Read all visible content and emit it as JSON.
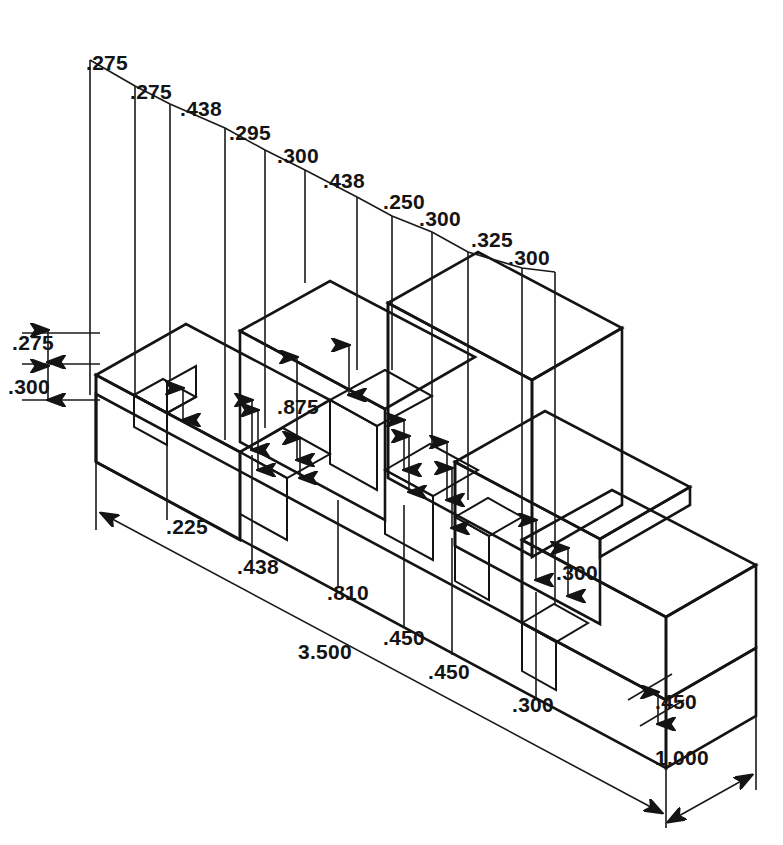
{
  "drawing": {
    "title": "Isometric dimensioned stepped slotted block",
    "view": "isometric",
    "units_implied": "inches",
    "background_color": "#ffffff",
    "line_color": "#141414",
    "face_colors": {
      "top": "#b9b9b9",
      "front": "#8a8a8a",
      "right": "#9e9e9e",
      "slot_inner_light": "#c4c4c4",
      "slot_inner_dark": "#7a7a7a"
    }
  },
  "top_chain": {
    "label": "top-dimension-chain",
    "description": "Stacked chain of length dimensions along the top, stepping down to the right",
    "values": [
      ".275",
      ".275",
      ".438",
      ".295",
      ".300",
      ".438",
      ".250",
      ".300",
      ".325",
      ".300"
    ]
  },
  "left_chain": {
    "label": "left-height-dimensions",
    "values": [
      ".275",
      ".300"
    ]
  },
  "bottom_chain": {
    "label": "bottom-dimension-chain",
    "values": [
      ".225",
      ".438",
      ".810",
      "3.500",
      ".450",
      ".450",
      ".300"
    ]
  },
  "right_dims": {
    "label": "right-side-dimensions",
    "values": [
      ".300",
      ".450",
      "1.000"
    ]
  },
  "center_dim": {
    "label": "center-height-dimension",
    "value": ".875"
  },
  "overall": {
    "length": "3.500",
    "depth": "1.000"
  },
  "all_dimension_texts": [
    ".275",
    ".275",
    ".438",
    ".295",
    ".300",
    ".438",
    ".250",
    ".300",
    ".325",
    ".300",
    ".275",
    ".300",
    ".875",
    ".225",
    ".438",
    ".810",
    "3.500",
    ".450",
    ".450",
    ".300",
    ".300",
    ".450",
    "1.000"
  ]
}
